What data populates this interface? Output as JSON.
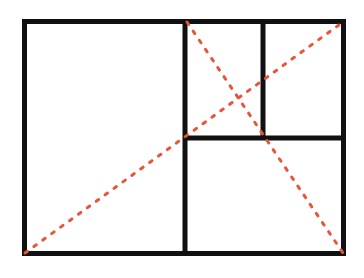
{
  "diagram": {
    "colors": {
      "line": "#111111",
      "diagonal": "#e8553a",
      "background": "#ffffff"
    },
    "outer_rect": {
      "x1": 24.5,
      "y1": 21.5,
      "x2": 343.5,
      "y2": 253.5,
      "stroke_width": 5
    },
    "dividers": [
      {
        "name": "main-vertical-divider",
        "x1": 185,
        "y1": 21.5,
        "x2": 185,
        "y2": 253.5
      },
      {
        "name": "horizontal-divider",
        "x1": 185,
        "y1": 138,
        "x2": 343.5,
        "y2": 138
      },
      {
        "name": "small-vertical-divider",
        "x1": 263,
        "y1": 21.5,
        "x2": 263,
        "y2": 138
      }
    ],
    "diagonals": [
      {
        "name": "long-diagonal",
        "x1": 25,
        "y1": 253,
        "x2": 343,
        "y2": 22
      },
      {
        "name": "short-diagonal",
        "x1": 187,
        "y1": 22,
        "x2": 343,
        "y2": 253
      }
    ]
  }
}
